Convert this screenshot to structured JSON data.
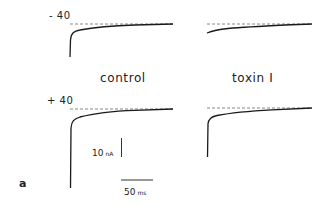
{
  "figure": {
    "panel_label": "a",
    "voltage_labels": {
      "top": "- 40",
      "bottom": "+ 40"
    },
    "conditions": {
      "left": "control",
      "right": "toxin I"
    },
    "scale_bar": {
      "current_value": "10",
      "current_unit": "nA",
      "time_value": "50",
      "time_unit": "ms"
    },
    "traces": [
      {
        "row": "top",
        "voltage": "-40",
        "condition": "control",
        "peak_px_below_baseline": 33
      },
      {
        "row": "top",
        "voltage": "-40",
        "condition": "toxin I",
        "peak_px_below_baseline": 9
      },
      {
        "row": "bottom",
        "voltage": "+40",
        "condition": "control",
        "peak_px_below_baseline": 79
      },
      {
        "row": "bottom",
        "voltage": "+40",
        "condition": "toxin I",
        "peak_px_below_baseline": 49
      }
    ],
    "colors": {
      "trace": "#1a1a1a",
      "baseline": "#555555"
    }
  }
}
